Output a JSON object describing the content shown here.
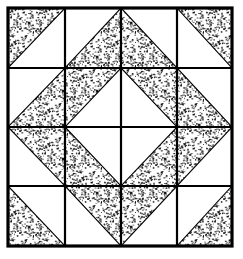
{
  "figure": {
    "name": "quilt-block-diagram",
    "title": "Pieced Quilt Block",
    "type": "line-art-diagram"
  },
  "canvas": {
    "width": 243,
    "height": 259,
    "background_color": "#ffffff"
  },
  "style": {
    "ink_color": "#000000",
    "fill_color": "#ffffff",
    "stipple_color": "#111111",
    "outer_border_width": 3.2,
    "grid_line_width": 2.2,
    "diagonal_line_width": 1.1
  },
  "block": {
    "left": 8,
    "top": 8,
    "right": 232,
    "bottom": 246,
    "rows": 4,
    "columns": 4,
    "vertical_grid_x": [
      65,
      121,
      177
    ],
    "horizontal_grid_y": [
      68,
      127,
      186
    ],
    "column_edges": [
      8,
      65,
      121,
      177,
      232
    ],
    "row_edges": [
      8,
      68,
      127,
      186,
      246
    ]
  },
  "legend": {
    "stipple_label": "textured patch",
    "plain_label": "plain patch"
  },
  "cells": [
    {
      "row": 0,
      "col": 0,
      "name": "cell-r0c0",
      "shading": "stipple",
      "triangle": "tl"
    },
    {
      "row": 0,
      "col": 1,
      "name": "cell-r0c1",
      "shading": "stipple",
      "triangle": "br"
    },
    {
      "row": 0,
      "col": 2,
      "name": "cell-r0c2",
      "shading": "stipple",
      "triangle": "bl"
    },
    {
      "row": 0,
      "col": 3,
      "name": "cell-r0c3",
      "shading": "stipple",
      "triangle": "tr"
    },
    {
      "row": 1,
      "col": 0,
      "name": "cell-r1c0",
      "shading": "stipple",
      "triangle": "br"
    },
    {
      "row": 1,
      "col": 1,
      "name": "cell-r1c1",
      "shading": "stipple",
      "triangle": "tl"
    },
    {
      "row": 1,
      "col": 2,
      "name": "cell-r1c2",
      "shading": "stipple",
      "triangle": "tr"
    },
    {
      "row": 1,
      "col": 3,
      "name": "cell-r1c3",
      "shading": "stipple",
      "triangle": "bl"
    },
    {
      "row": 2,
      "col": 0,
      "name": "cell-r2c0",
      "shading": "stipple",
      "triangle": "tr"
    },
    {
      "row": 2,
      "col": 1,
      "name": "cell-r2c1",
      "shading": "stipple",
      "triangle": "bl"
    },
    {
      "row": 2,
      "col": 2,
      "name": "cell-r2c2",
      "shading": "stipple",
      "triangle": "br"
    },
    {
      "row": 2,
      "col": 3,
      "name": "cell-r2c3",
      "shading": "stipple",
      "triangle": "tl"
    },
    {
      "row": 3,
      "col": 0,
      "name": "cell-r3c0",
      "shading": "stipple",
      "triangle": "bl"
    },
    {
      "row": 3,
      "col": 1,
      "name": "cell-r3c1",
      "shading": "stipple",
      "triangle": "tr"
    },
    {
      "row": 3,
      "col": 2,
      "name": "cell-r3c2",
      "shading": "stipple",
      "triangle": "tl"
    },
    {
      "row": 3,
      "col": 3,
      "name": "cell-r3c3",
      "shading": "stipple",
      "triangle": "br"
    }
  ]
}
